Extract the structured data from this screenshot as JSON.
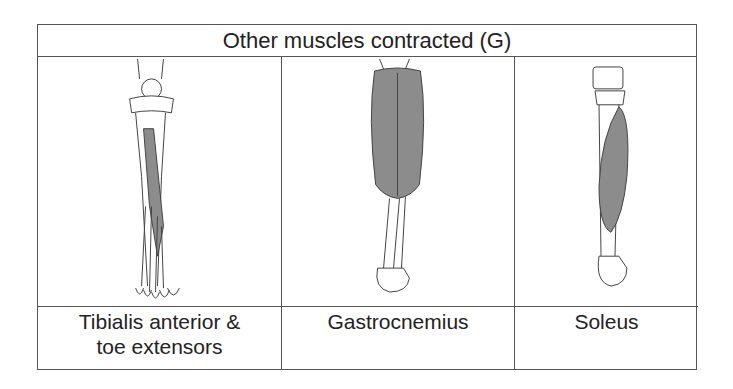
{
  "table": {
    "title": "Other muscles contracted (G)",
    "columns": [
      {
        "label_line1": "Tibialis anterior &",
        "label_line2": "toe extensors",
        "illustration": "tibialis-anterior-leg-illustration"
      },
      {
        "label_line1": "Gastrocnemius",
        "label_line2": "",
        "illustration": "gastrocnemius-leg-illustration"
      },
      {
        "label_line1": "Soleus",
        "label_line2": "",
        "illustration": "soleus-leg-illustration"
      }
    ]
  },
  "colors": {
    "muscle": "#8c8c8c",
    "outline": "#444444",
    "border": "#555555"
  }
}
